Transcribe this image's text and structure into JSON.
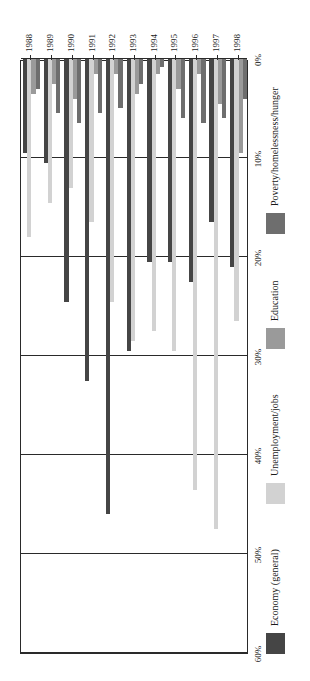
{
  "chart_data": {
    "type": "bar",
    "orientation": "horizontal",
    "title": "",
    "subtitle": "",
    "xlabel": "",
    "ylabel": "",
    "xlim": [
      0,
      60
    ],
    "xtick_labels": [
      "0%",
      "10%",
      "20%",
      "30%",
      "40%",
      "50%",
      "60%"
    ],
    "xticks": [
      0,
      10,
      20,
      30,
      40,
      50,
      60
    ],
    "grid": true,
    "legend_position": "bottom",
    "categories": [
      "1988",
      "1989",
      "1990",
      "1991",
      "1992",
      "1993",
      "1994",
      "1995",
      "1996",
      "1997",
      "1998"
    ],
    "series": [
      {
        "name": "Economy (general)",
        "color": "#454545",
        "values": [
          9.5,
          10.5,
          24.5,
          32.5,
          46.0,
          29.5,
          20.5,
          20.5,
          22.5,
          16.5,
          21.0
        ]
      },
      {
        "name": "Unemployment/jobs",
        "color": "#d2d2d2",
        "values": [
          18.0,
          14.5,
          13.0,
          16.5,
          24.5,
          28.5,
          27.5,
          29.5,
          43.5,
          47.5,
          26.5
        ]
      },
      {
        "name": "Education",
        "color": "#9a9a9a",
        "values": [
          3.5,
          2.5,
          4.0,
          1.5,
          1.5,
          3.5,
          1.5,
          3.0,
          1.5,
          4.5,
          9.5
        ]
      },
      {
        "name": "Poverty/homelessness/hunger",
        "color": "#6e6e6e",
        "values": [
          3.0,
          5.5,
          6.5,
          5.5,
          5.0,
          2.5,
          0.8,
          6.0,
          6.5,
          6.0,
          4.0
        ]
      }
    ]
  },
  "axis": {
    "x_tick_labels": [
      "60%",
      "50%",
      "40%",
      "30%",
      "20%",
      "10%",
      "0%"
    ],
    "y_tick_labels": [
      "1998",
      "1997",
      "1996",
      "1995",
      "1994",
      "1993",
      "1992",
      "1991",
      "1990",
      "1989",
      "1988"
    ]
  },
  "legend": {
    "entries": [
      {
        "label": "Economy (general)",
        "color": "#454545"
      },
      {
        "label": "Unemployment/jobs",
        "color": "#d2d2d2"
      },
      {
        "label": "Education",
        "color": "#9a9a9a"
      },
      {
        "label": "Poverty/homelessness/hunger",
        "color": "#6e6e6e"
      }
    ]
  }
}
